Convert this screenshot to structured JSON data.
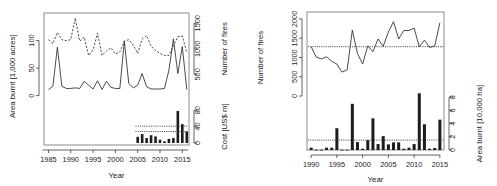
{
  "figure": {
    "panels": [
      "left",
      "right"
    ],
    "background": "#ffffff",
    "ink": "#1c1c1c"
  },
  "chart_data": [
    {
      "id": "panel-left",
      "type": "line",
      "title": "",
      "xlabel": "Year",
      "ylabel": "Area burnt [1,000 acres]",
      "y2label_top": "Number of fires",
      "y2label_bottom": "Cost [US$ m]",
      "grid": false,
      "legend": "none",
      "xlim": [
        1984,
        2016.5
      ],
      "xticks": [
        1985,
        1990,
        1995,
        2000,
        2005,
        2010,
        2015
      ],
      "xticklabels": [
        "1985",
        "1990",
        "1995",
        "2000",
        "2005",
        "2010",
        "2015"
      ],
      "ylim": [
        -8,
        150
      ],
      "yticks": [
        0,
        50,
        100
      ],
      "yticklabels": [
        "0",
        "50",
        "100"
      ],
      "y2_top_ticks": [
        500,
        1000,
        1500
      ],
      "y2_top_ticklabels": [
        "500",
        "1000",
        "1500"
      ],
      "y2_top_lim": [
        0,
        1700
      ],
      "y2_bottom_ticks": [
        0,
        40,
        80
      ],
      "y2_bottom_ticklabels": [
        "0",
        "40",
        "80"
      ],
      "y2_bottom_lim": [
        0,
        95
      ],
      "x": [
        1985,
        1986,
        1987,
        1988,
        1989,
        1990,
        1991,
        1992,
        1993,
        1994,
        1995,
        1996,
        1997,
        1998,
        1999,
        2000,
        2001,
        2002,
        2003,
        2004,
        2005,
        2006,
        2007,
        2008,
        2009,
        2010,
        2011,
        2012,
        2013,
        2014,
        2015,
        2016
      ],
      "series": [
        {
          "name": "Area burnt [1,000 acres]",
          "style": "solid",
          "axis": "left",
          "values": [
            11,
            17,
            88,
            17,
            13,
            13,
            14,
            13,
            26,
            19,
            12,
            27,
            11,
            26,
            15,
            13,
            13,
            99,
            22,
            14,
            19,
            40,
            16,
            12,
            12,
            12,
            13,
            46,
            103,
            40,
            89,
            11
          ]
        },
        {
          "name": "Number of fires",
          "style": "dashed",
          "axis": "right-top",
          "values": [
            1180,
            1100,
            1320,
            1180,
            1160,
            1180,
            1600,
            1150,
            1230,
            870,
            980,
            1310,
            870,
            960,
            1020,
            900,
            940,
            1150,
            1180,
            1070,
            910,
            1190,
            1260,
            1050,
            970,
            910,
            870,
            870,
            1060,
            1240,
            1250,
            930
          ]
        }
      ],
      "bars": {
        "name": "Cost [US$ m]",
        "axis": "right-bottom",
        "x": [
          2005,
          2006,
          2007,
          2008,
          2009,
          2010,
          2011,
          2012,
          2013,
          2014,
          2015,
          2016
        ],
        "values": [
          15,
          22,
          12,
          19,
          16,
          8,
          4,
          10,
          12,
          78,
          46,
          28
        ]
      },
      "reference_lines": [
        {
          "name": "upper-mean",
          "axis": "right-bottom",
          "value": 41,
          "x_from": 2004.5,
          "x_to": 2016.3,
          "style": "dotted"
        },
        {
          "name": "lower-mean",
          "axis": "right-bottom",
          "value": 28,
          "x_from": 2004.5,
          "x_to": 2016.3,
          "style": "dotted"
        }
      ]
    },
    {
      "id": "panel-right",
      "type": "line",
      "title": "",
      "xlabel": "Year",
      "ylabel": "Number of fires",
      "y2label": "Area burnt [10,000 ha]",
      "grid": false,
      "legend": "none",
      "xlim": [
        1989.2,
        2015.8
      ],
      "xticks": [
        1990,
        1995,
        2000,
        2005,
        2010,
        2015
      ],
      "xticklabels": [
        "1990",
        "1995",
        "2000",
        "2005",
        "2010",
        "2015"
      ],
      "ylim": [
        -1400,
        2180
      ],
      "yticks": [
        0,
        500,
        1000,
        1500,
        2000
      ],
      "yticklabels": [
        "0",
        "500",
        "1000",
        "1500",
        "2000"
      ],
      "y2lim": [
        0,
        9.4
      ],
      "y2ticks": [
        0,
        2,
        4,
        6,
        8
      ],
      "y2ticklabels": [
        "0",
        "2",
        "4",
        "6",
        "8"
      ],
      "x": [
        1990,
        1991,
        1992,
        1993,
        1994,
        1995,
        1996,
        1997,
        1998,
        1999,
        2000,
        2001,
        2002,
        2003,
        2004,
        2005,
        2006,
        2007,
        2008,
        2009,
        2010,
        2011,
        2012,
        2013,
        2014,
        2015
      ],
      "series": [
        {
          "name": "Number of fires",
          "style": "solid",
          "axis": "left",
          "values": [
            1280,
            1010,
            960,
            1020,
            900,
            830,
            620,
            680,
            1710,
            1100,
            830,
            1300,
            1150,
            1480,
            1290,
            1660,
            1930,
            1480,
            1700,
            1700,
            1760,
            1280,
            1450,
            1260,
            1300,
            1900
          ]
        }
      ],
      "bars": {
        "name": "Area burnt [10,000 ha]",
        "axis": "right",
        "x": [
          1990,
          1991,
          1992,
          1993,
          1994,
          1995,
          1996,
          1997,
          1998,
          1999,
          2000,
          2001,
          2002,
          2003,
          2004,
          2005,
          2006,
          2007,
          2008,
          2009,
          2010,
          2011,
          2012,
          2013,
          2014,
          2015
        ],
        "values": [
          0.35,
          0.05,
          0.05,
          0.35,
          0.35,
          3.3,
          0.05,
          0.05,
          7.0,
          1.2,
          0.2,
          1.5,
          4.8,
          0.9,
          2.1,
          0.85,
          1.15,
          1.15,
          0.2,
          0.35,
          0.9,
          8.6,
          3.9,
          0.2,
          0.3,
          4.6
        ]
      },
      "reference_lines": [
        {
          "name": "fires-mean",
          "axis": "left",
          "value": 1280,
          "x_from": 1989.4,
          "x_to": 2015.7,
          "style": "dotted"
        },
        {
          "name": "area-mean",
          "axis": "right",
          "value": 1.5,
          "x_from": 1989.4,
          "x_to": 2015.7,
          "style": "dotted"
        }
      ]
    }
  ]
}
